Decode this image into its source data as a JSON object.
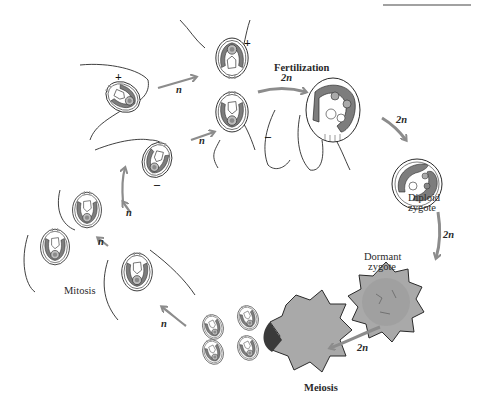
{
  "diagram": {
    "type": "life-cycle",
    "colors": {
      "arrow": "#8c8c8c",
      "chloroplast": "#7d7d7d",
      "chloroplast_light": "#b8b8b8",
      "zygote_wall": "#a9a9a9",
      "outline": "#2a2a2a",
      "background": "#ffffff"
    },
    "stages": {
      "fertilization": "Fertilization",
      "diploid_zygote": [
        "Diploid",
        "zygote"
      ],
      "dormant_zygote": [
        "Dormant",
        "zygote"
      ],
      "meiosis": "Meiosis",
      "mitosis": "Mitosis"
    },
    "mating_types": {
      "plus": "+",
      "minus": "–"
    },
    "ploidy_labels": {
      "haploid": "n",
      "diploid": "2n"
    },
    "arrows": [
      {
        "from": "plus-gamete",
        "to": "fertilization",
        "label": "n"
      },
      {
        "from": "minus-gamete",
        "to": "fertilization",
        "label": "n"
      },
      {
        "from": "fertilization",
        "to": "quadriflagellate-zygote",
        "label": "2n"
      },
      {
        "from": "quadriflagellate-zygote",
        "to": "diploid-zygote",
        "label": "2n"
      },
      {
        "from": "diploid-zygote",
        "to": "dormant-zygote",
        "label": "2n"
      },
      {
        "from": "dormant-zygote",
        "to": "meiosis",
        "label": "2n"
      },
      {
        "from": "meiosis",
        "to": "haploid-cell",
        "label": "n"
      },
      {
        "from": "haploid-cell",
        "to": "mitosis",
        "label": "n"
      },
      {
        "from": "mitosis",
        "to": "minus-gamete",
        "label": "n"
      }
    ]
  }
}
